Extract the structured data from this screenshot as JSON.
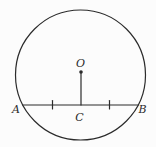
{
  "diagram": {
    "type": "geometry-circle-chord",
    "line_color": "#2b2b2b",
    "background_color": "#fcfcfc",
    "labels": {
      "center": "O",
      "chord_left": "A",
      "chord_right": "B",
      "chord_midpoint": "C"
    },
    "relations": {
      "center_point": "O",
      "chord": "AB",
      "foot_of_perpendicular": "C",
      "equal_segments": [
        "AC",
        "CB"
      ],
      "tick_marks": 2
    }
  }
}
